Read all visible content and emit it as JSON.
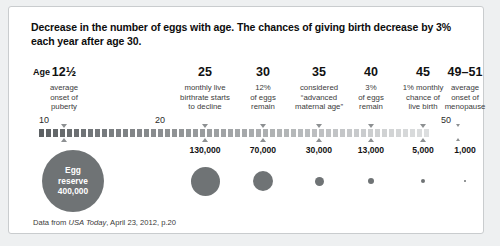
{
  "title": "Decrease in the number of eggs with age. The chances of giving birth decrease by 3% each year after age 30.",
  "age_label": "Age",
  "axis": {
    "ticks": [
      "10",
      "20",
      "50"
    ],
    "bar_color_start": "#5c6063",
    "bar_color_end": "#dcdedf",
    "marker_color": "#8d9092"
  },
  "columns": [
    {
      "age": "12½",
      "caption": "average\nonset of\npuberty",
      "value": "",
      "bubble_px": 0
    },
    {
      "age": "25",
      "caption": "monthly live\nbirthrate starts\nto decline",
      "value": "130,000",
      "bubble_px": 29
    },
    {
      "age": "30",
      "caption": "12%\nof eggs\nremain",
      "value": "70,000",
      "bubble_px": 20
    },
    {
      "age": "35",
      "caption": "considered\n“advanced\nmaternal age”",
      "value": "30,000",
      "bubble_px": 9
    },
    {
      "age": "40",
      "caption": "3%\nof eggs\nremain",
      "value": "13,000",
      "bubble_px": 6
    },
    {
      "age": "45",
      "caption": "1% monthly\nchance of\nlive birth",
      "value": "5,000",
      "bubble_px": 4.2
    },
    {
      "age": "49–51",
      "caption": "average\nonset of\nmenopause",
      "value": "1,000",
      "bubble_px": 2.4
    }
  ],
  "reserve": {
    "line1": "Egg",
    "line2": "reserve",
    "line3": "400,000",
    "color": "#6f7375"
  },
  "source": {
    "prefix": "Data from ",
    "italic": "USA Today",
    "suffix": ", April 23, 2012, p.20"
  },
  "chart_data": {
    "type": "scatter",
    "title": "Decrease in the number of eggs with age. The chances of giving birth decrease by 3% each year after age 30.",
    "xlabel": "Age",
    "ylabel": "Egg reserve",
    "x": [
      "12½",
      "25",
      "30",
      "35",
      "40",
      "45",
      "49–51"
    ],
    "values": [
      400000,
      130000,
      70000,
      30000,
      13000,
      5000,
      1000
    ],
    "value_labels": [
      "400,000",
      "130,000",
      "70,000",
      "30,000",
      "13,000",
      "5,000",
      "1,000"
    ],
    "axis_ticks": [
      10,
      20,
      50
    ],
    "axis_range": [
      10,
      52
    ],
    "grid": false,
    "legend": "none",
    "annotations": [
      "average onset of puberty",
      "monthly live birthrate starts to decline",
      "12% of eggs remain",
      "considered “advanced maternal age”",
      "3% of eggs remain",
      "1% monthly chance of live birth",
      "average onset of menopause"
    ]
  }
}
